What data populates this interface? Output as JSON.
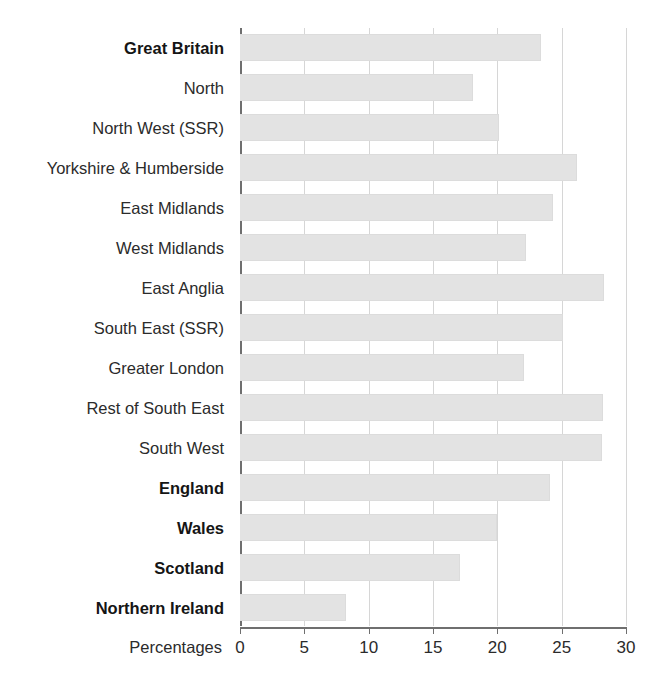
{
  "chart_data": {
    "type": "bar",
    "orientation": "horizontal",
    "title": "",
    "subtitle": "",
    "xlabel": "Percentages",
    "ylabel": "",
    "xlim": [
      0,
      30
    ],
    "xticks": [
      0,
      5,
      10,
      15,
      20,
      25,
      30
    ],
    "xtick_labels": [
      "0",
      "5",
      "10",
      "15",
      "20",
      "25",
      "30"
    ],
    "grid": true,
    "grid_axis": "x",
    "legend": false,
    "legend_position": "none",
    "bar_fill_color": "#e3e3e3",
    "bar_edge_color": "#dcdcdc",
    "axis_color": "#6f6f6f",
    "gridline_color": "#d6d6d6",
    "categories": [
      "Great Britain",
      "North",
      "North West (SSR)",
      "Yorkshire & Humberside",
      "East Midlands",
      "West Midlands",
      "East Anglia",
      "South East (SSR)",
      "Greater London",
      "Rest of South East",
      "South West",
      "England",
      "Wales",
      "Scotland",
      "Northern Ireland"
    ],
    "values": [
      23.4,
      18.1,
      20.1,
      26.2,
      24.3,
      22.2,
      28.3,
      25.1,
      22.1,
      28.2,
      28.1,
      24.1,
      20.0,
      17.1,
      8.2
    ],
    "bold_categories": [
      "Great Britain",
      "England",
      "Wales",
      "Scotland",
      "Northern Ireland"
    ]
  }
}
